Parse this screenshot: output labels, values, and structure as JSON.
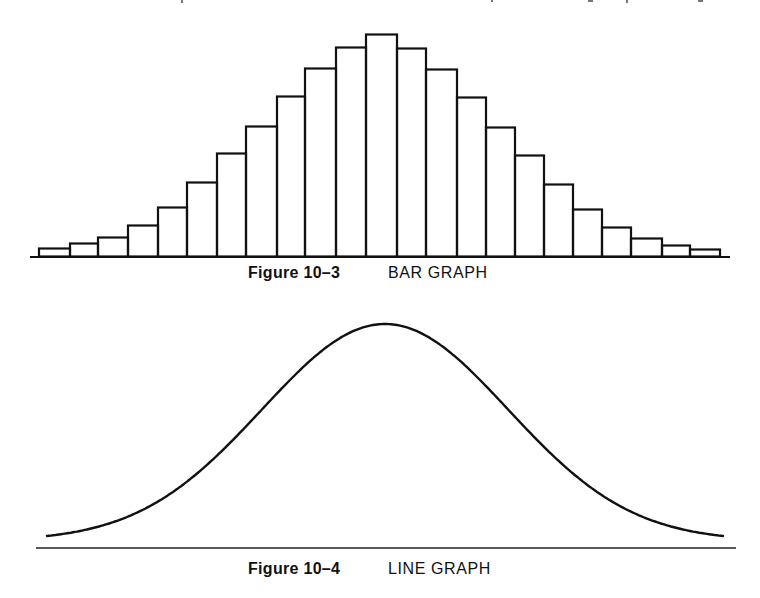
{
  "colors": {
    "ink": "#111111",
    "background": "#ffffff"
  },
  "figures": [
    {
      "number_label": "Figure 10–3",
      "title": "BAR GRAPH"
    },
    {
      "number_label": "Figure 10–4",
      "title": "LINE GRAPH"
    }
  ],
  "chart_data": [
    {
      "type": "bar",
      "title": "Figure 10–3 BAR GRAPH",
      "xlabel": "",
      "ylabel": "",
      "grid": false,
      "legend": "none",
      "categories": [
        "1",
        "2",
        "3",
        "4",
        "5",
        "6",
        "7",
        "8",
        "9",
        "10",
        "11",
        "12",
        "13",
        "14",
        "15",
        "16",
        "17",
        "18",
        "19",
        "20",
        "21",
        "22",
        "23"
      ],
      "values": [
        8,
        13,
        19,
        31,
        49,
        74,
        103,
        130,
        160,
        188,
        209,
        222,
        208,
        187,
        159,
        129,
        101,
        72,
        47,
        29,
        18,
        11,
        7
      ],
      "units_note": "relative heights in pixels above baseline (no axis labels shown)",
      "ylim": [
        0,
        230
      ],
      "layout": {
        "baseline_y": 256.5,
        "axis_x_start": 30,
        "axis_x_end": 730,
        "bar_edges": [
          39,
          70,
          98,
          128,
          158,
          187,
          217,
          246,
          277,
          305,
          336,
          366,
          397,
          426,
          457,
          486,
          515,
          544,
          573,
          602,
          631,
          662,
          690,
          720
        ]
      }
    },
    {
      "type": "line",
      "title": "Figure 10–4 LINE GRAPH",
      "xlabel": "",
      "ylabel": "",
      "grid": false,
      "legend": "none",
      "description": "Smooth bell-shaped (normal distribution) curve",
      "series": [
        {
          "name": "curve",
          "x": [
            47,
            100,
            150,
            200,
            230,
            260,
            285,
            320,
            350,
            385,
            420,
            450,
            485,
            510,
            540,
            570,
            620,
            670,
            723
          ],
          "y": [
            5,
            13,
            27,
            51,
            68,
            88,
            104,
            132,
            155,
            217,
            155,
            132,
            104,
            88,
            68,
            51,
            25,
            12,
            5
          ]
        }
      ],
      "layout": {
        "baseline_y": 548,
        "axis_x_start": 36,
        "axis_x_end": 736,
        "curve_start_x": 47,
        "curve_end_x": 723,
        "peak_x": 385,
        "peak_y": 324,
        "curve_floor_y": 541,
        "sigma_px": 123
      }
    }
  ]
}
